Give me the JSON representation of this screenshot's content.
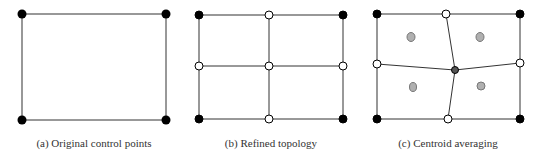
{
  "panels": [
    {
      "caption": "(a) Original control points"
    },
    {
      "caption": "(b) Refined topology"
    },
    {
      "caption": "(c) Centroid averaging"
    }
  ],
  "colors": {
    "line": "#333333",
    "corner_point": "#000000",
    "new_point": "#ffffff",
    "centroid_point": "#b0b0b0",
    "averaged_point": "#555555"
  }
}
